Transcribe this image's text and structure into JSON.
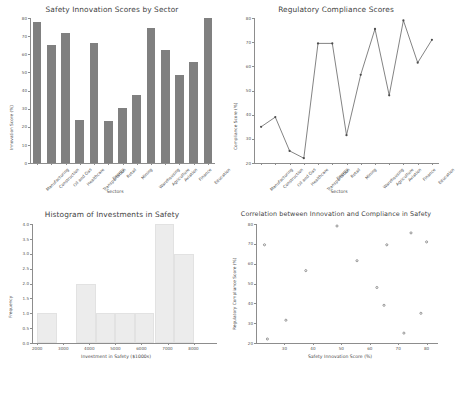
{
  "figure": {
    "background": "#ffffff",
    "bar_color": "#808080",
    "hist_color": "#ececec",
    "line_color": "#4d4d4d",
    "marker_color": "#6f6f6f",
    "axis_color": "#8d8d8d"
  },
  "sectors": [
    "Manufacturing",
    "Construction",
    "Oil and Gas",
    "Healthcare",
    "Transportation",
    "Energy",
    "Retail",
    "Mining",
    "Warehousing",
    "Agriculture",
    "Aviation",
    "Finance",
    "Education"
  ],
  "chart_data": [
    {
      "type": "bar",
      "id": "innovation-bar",
      "title": "Safety Innovation Scores by Sector",
      "xlabel": "Sectors",
      "ylabel": "Innovation Score (%)",
      "categories": [
        "Manufacturing",
        "Construction",
        "Oil and Gas",
        "Healthcare",
        "Transportation",
        "Energy",
        "Retail",
        "Mining",
        "Warehousing",
        "Agriculture",
        "Aviation",
        "Finance",
        "Education"
      ],
      "values": [
        78,
        65,
        72,
        24,
        66,
        23,
        30.5,
        37.5,
        74.5,
        62.5,
        48.5,
        55.5,
        80
      ],
      "ylim": [
        0,
        80
      ],
      "yticks": [
        0,
        10,
        20,
        30,
        40,
        50,
        60,
        70,
        80
      ],
      "grid": false,
      "legend": "none"
    },
    {
      "type": "line",
      "id": "compliance-line",
      "title": "Regulatory Compliance Scores",
      "xlabel": "Sectors",
      "ylabel": "Compliance Score (%)",
      "categories": [
        "Manufacturing",
        "Construction",
        "Oil and Gas",
        "Healthcare",
        "Transportation",
        "Energy",
        "Retail",
        "Mining",
        "Warehousing",
        "Agriculture",
        "Aviation",
        "Finance",
        "Education"
      ],
      "values": [
        35,
        39,
        25,
        22,
        69.5,
        69.5,
        31.5,
        56.5,
        75.5,
        48,
        79,
        61.5,
        71
      ],
      "ylim": [
        20,
        80
      ],
      "yticks": [
        20,
        30,
        40,
        50,
        60,
        70,
        80
      ],
      "marker": "diamond",
      "grid": false,
      "legend": "none"
    },
    {
      "type": "bar",
      "id": "investment-histogram",
      "title": "Histogram of Investments in Safety",
      "xlabel": "Investment in Safety ($1000s)",
      "ylabel": "Frequency",
      "bin_edges": [
        2000,
        2750,
        3500,
        4250,
        5000,
        5750,
        6500,
        7250,
        8000,
        8750
      ],
      "bin_counts": [
        1,
        0,
        2,
        1,
        1,
        1,
        4,
        3,
        0
      ],
      "ylim": [
        0,
        4
      ],
      "yticks": [
        0.0,
        0.5,
        1.0,
        1.5,
        2.0,
        2.5,
        3.0,
        3.5,
        4.0
      ],
      "ytick_labels": [
        "0.0",
        "0.5",
        "1.0",
        "1.5",
        "2.0",
        "2.5",
        "3.0",
        "3.5",
        "4.0"
      ],
      "xlim": [
        1800,
        8900
      ],
      "xticks": [
        2000,
        3000,
        4000,
        5000,
        6000,
        7000,
        8000
      ],
      "grid": false,
      "legend": "none"
    },
    {
      "type": "scatter",
      "id": "correlation-scatter",
      "title": "Correlation between Innovation and Compliance in Safety",
      "xlabel": "Safety Innovation Score (%)",
      "ylabel": "Regulatory Compliance Score (%)",
      "x": [
        78,
        65,
        72,
        24,
        66,
        23,
        30.5,
        37.5,
        74.5,
        62.5,
        48.5,
        55.5,
        80
      ],
      "y": [
        35,
        39,
        25,
        22,
        69.5,
        69.5,
        31.5,
        56.5,
        75.5,
        48,
        79,
        61.5,
        71
      ],
      "point_labels": [
        "Manufacturing",
        "Construction",
        "Oil and Gas",
        "Healthcare",
        "Transportation",
        "Energy",
        "Retail",
        "Mining",
        "Warehousing",
        "Agriculture",
        "Aviation",
        "Finance",
        "Education"
      ],
      "xlim": [
        20,
        84
      ],
      "ylim": [
        20,
        80
      ],
      "xticks": [
        30,
        40,
        50,
        60,
        70,
        80
      ],
      "yticks": [
        20,
        30,
        40,
        50,
        60,
        70,
        80
      ],
      "marker": "diamond",
      "grid": false,
      "legend": "none"
    }
  ]
}
